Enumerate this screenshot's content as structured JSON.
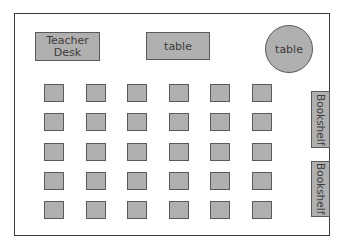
{
  "diagram": {
    "teacher_desk": {
      "label_line1": "Teacher",
      "label_line2": "Desk"
    },
    "rect_table": {
      "label": "table"
    },
    "round_table": {
      "label": "table"
    },
    "bookshelves": [
      {
        "label": "Bookshelf"
      },
      {
        "label": "Bookshelf"
      }
    ],
    "student_desks": {
      "rows": 5,
      "columns": 6
    },
    "colors": {
      "furniture_fill": "#b0b0b0",
      "furniture_border": "#5a5a5a",
      "wall": "#3a3a3a",
      "text": "#3c3c3c"
    }
  }
}
